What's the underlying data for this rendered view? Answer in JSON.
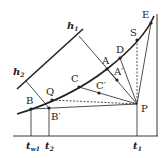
{
  "diagram": {
    "colors": {
      "line": "#222222",
      "background": "#ffffff"
    },
    "labels": {
      "h1": "h",
      "h1_sub": "1",
      "h2": "h",
      "h2_sub": "2",
      "A": "A",
      "A_prime": "A′",
      "B": "B",
      "B_prime": "B′",
      "C": "C",
      "C_prime": "C′",
      "D": "D",
      "E": "E",
      "S": "S",
      "Q": "Q",
      "P": "P",
      "t_w1": "t",
      "t_w1_sub": "w1",
      "t2": "t",
      "t2_sub": "2",
      "t1": "t",
      "t1_sub": "1"
    },
    "points": {
      "B": [
        31,
        109
      ],
      "Q": [
        52,
        100
      ],
      "C": [
        79,
        87
      ],
      "A": [
        107,
        69
      ],
      "D": [
        120,
        58
      ],
      "S": [
        137,
        40
      ],
      "E": [
        151,
        23
      ],
      "P": [
        137,
        104
      ],
      "B_prime": [
        49,
        108
      ],
      "C_prime": [
        99,
        93
      ],
      "A_prime": [
        117,
        80
      ]
    }
  }
}
